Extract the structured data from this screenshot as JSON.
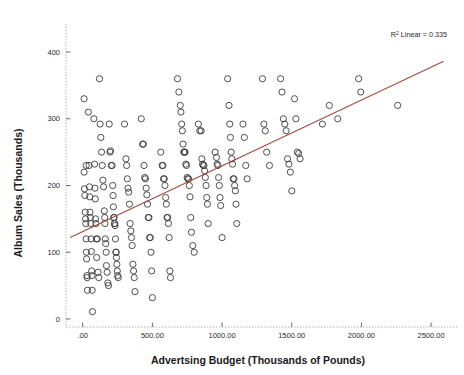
{
  "chart_data": {
    "type": "scatter",
    "title": "",
    "xlabel": "Advertsing Budget (Thousands of Pounds)",
    "ylabel": "Album Sales (Thousands)",
    "xlim": [
      -120,
      2650
    ],
    "ylim": [
      -12,
      430
    ],
    "xticks": [
      0,
      500,
      1000,
      1500,
      2000,
      2500
    ],
    "xticklabels": [
      ".00",
      "500.00",
      "1000.00",
      "1500.00",
      "2000.00",
      "2500.00"
    ],
    "yticks": [
      0,
      100,
      200,
      300,
      400
    ],
    "yticklabels": [
      "0",
      "100",
      "200",
      "300",
      "400"
    ],
    "grid": false,
    "legend": null,
    "annotations": [
      {
        "name": "r-squared",
        "prefix": "R",
        "superscript": "2",
        "text": " Linear = 0.335",
        "full_text": "R2 Linear = 0.335",
        "value": 0.335,
        "x": 2350,
        "y": 425
      }
    ],
    "marker": {
      "shape": "open-circle",
      "radius_px": 3.1,
      "stroke": "#3a3a3a",
      "fill": "none"
    },
    "fit_line": {
      "name": "linear-fit",
      "color": "#a24a3c",
      "x_start": -90,
      "y_start": 122,
      "x_end": 2590,
      "y_end": 386,
      "slope": 0.0985,
      "intercept": 131.0
    },
    "n_points": 200,
    "points": [
      [
        10,
        330
      ],
      [
        25,
        230
      ],
      [
        10,
        220
      ],
      [
        12,
        195
      ],
      [
        15,
        185
      ],
      [
        18,
        160
      ],
      [
        20,
        150
      ],
      [
        22,
        143
      ],
      [
        24,
        120
      ],
      [
        26,
        100
      ],
      [
        28,
        90
      ],
      [
        30,
        65
      ],
      [
        32,
        62
      ],
      [
        34,
        43
      ],
      [
        40,
        310
      ],
      [
        45,
        230
      ],
      [
        48,
        198
      ],
      [
        50,
        183
      ],
      [
        52,
        160
      ],
      [
        55,
        152
      ],
      [
        58,
        143
      ],
      [
        60,
        120
      ],
      [
        62,
        101
      ],
      [
        64,
        72
      ],
      [
        66,
        65
      ],
      [
        68,
        43
      ],
      [
        70,
        11
      ],
      [
        80,
        300
      ],
      [
        85,
        232
      ],
      [
        88,
        196
      ],
      [
        90,
        180
      ],
      [
        92,
        150
      ],
      [
        95,
        143
      ],
      [
        98,
        120
      ],
      [
        100,
        92
      ],
      [
        105,
        120
      ],
      [
        110,
        70
      ],
      [
        115,
        62
      ],
      [
        120,
        360
      ],
      [
        125,
        292
      ],
      [
        130,
        272
      ],
      [
        135,
        250
      ],
      [
        140,
        230
      ],
      [
        145,
        208
      ],
      [
        150,
        198
      ],
      [
        155,
        162
      ],
      [
        158,
        152
      ],
      [
        160,
        143
      ],
      [
        162,
        120
      ],
      [
        165,
        113
      ],
      [
        168,
        100
      ],
      [
        170,
        80
      ],
      [
        175,
        70
      ],
      [
        180,
        54
      ],
      [
        185,
        50
      ],
      [
        190,
        292
      ],
      [
        195,
        250
      ],
      [
        200,
        252
      ],
      [
        205,
        230
      ],
      [
        210,
        230
      ],
      [
        215,
        200
      ],
      [
        218,
        185
      ],
      [
        220,
        168
      ],
      [
        222,
        152
      ],
      [
        225,
        152
      ],
      [
        228,
        143
      ],
      [
        230,
        143
      ],
      [
        232,
        140
      ],
      [
        235,
        120
      ],
      [
        238,
        100
      ],
      [
        240,
        100
      ],
      [
        242,
        92
      ],
      [
        245,
        82
      ],
      [
        248,
        72
      ],
      [
        250,
        65
      ],
      [
        255,
        62
      ],
      [
        300,
        292
      ],
      [
        310,
        240
      ],
      [
        315,
        230
      ],
      [
        320,
        210
      ],
      [
        325,
        196
      ],
      [
        330,
        190
      ],
      [
        335,
        172
      ],
      [
        340,
        143
      ],
      [
        345,
        132
      ],
      [
        350,
        122
      ],
      [
        355,
        110
      ],
      [
        360,
        82
      ],
      [
        365,
        72
      ],
      [
        370,
        62
      ],
      [
        375,
        41
      ],
      [
        420,
        300
      ],
      [
        430,
        262
      ],
      [
        435,
        262
      ],
      [
        440,
        230
      ],
      [
        445,
        212
      ],
      [
        450,
        210
      ],
      [
        455,
        196
      ],
      [
        460,
        186
      ],
      [
        465,
        172
      ],
      [
        470,
        152
      ],
      [
        475,
        152
      ],
      [
        480,
        122
      ],
      [
        485,
        122
      ],
      [
        490,
        100
      ],
      [
        495,
        72
      ],
      [
        500,
        32
      ],
      [
        560,
        250
      ],
      [
        570,
        230
      ],
      [
        575,
        230
      ],
      [
        580,
        210
      ],
      [
        585,
        210
      ],
      [
        590,
        200
      ],
      [
        595,
        182
      ],
      [
        600,
        172
      ],
      [
        605,
        152
      ],
      [
        610,
        152
      ],
      [
        615,
        143
      ],
      [
        620,
        122
      ],
      [
        625,
        72
      ],
      [
        630,
        62
      ],
      [
        680,
        360
      ],
      [
        690,
        340
      ],
      [
        700,
        320
      ],
      [
        705,
        310
      ],
      [
        710,
        292
      ],
      [
        715,
        282
      ],
      [
        720,
        262
      ],
      [
        725,
        250
      ],
      [
        730,
        250
      ],
      [
        735,
        250
      ],
      [
        740,
        232
      ],
      [
        745,
        230
      ],
      [
        750,
        212
      ],
      [
        755,
        210
      ],
      [
        760,
        210
      ],
      [
        765,
        200
      ],
      [
        770,
        183
      ],
      [
        775,
        152
      ],
      [
        780,
        130
      ],
      [
        790,
        110
      ],
      [
        800,
        100
      ],
      [
        830,
        292
      ],
      [
        840,
        282
      ],
      [
        850,
        282
      ],
      [
        855,
        240
      ],
      [
        860,
        232
      ],
      [
        865,
        230
      ],
      [
        870,
        230
      ],
      [
        875,
        222
      ],
      [
        880,
        212
      ],
      [
        885,
        200
      ],
      [
        890,
        182
      ],
      [
        895,
        172
      ],
      [
        900,
        143
      ],
      [
        950,
        250
      ],
      [
        960,
        242
      ],
      [
        965,
        232
      ],
      [
        970,
        230
      ],
      [
        975,
        212
      ],
      [
        980,
        200
      ],
      [
        985,
        182
      ],
      [
        990,
        170
      ],
      [
        1000,
        122
      ],
      [
        1040,
        360
      ],
      [
        1050,
        320
      ],
      [
        1055,
        292
      ],
      [
        1060,
        272
      ],
      [
        1065,
        250
      ],
      [
        1070,
        240
      ],
      [
        1075,
        232
      ],
      [
        1080,
        210
      ],
      [
        1085,
        210
      ],
      [
        1090,
        200
      ],
      [
        1095,
        192
      ],
      [
        1100,
        172
      ],
      [
        1105,
        143
      ],
      [
        1150,
        292
      ],
      [
        1160,
        272
      ],
      [
        1170,
        230
      ],
      [
        1180,
        210
      ],
      [
        1290,
        360
      ],
      [
        1300,
        292
      ],
      [
        1310,
        282
      ],
      [
        1320,
        250
      ],
      [
        1340,
        230
      ],
      [
        1420,
        360
      ],
      [
        1430,
        340
      ],
      [
        1440,
        300
      ],
      [
        1450,
        292
      ],
      [
        1460,
        282
      ],
      [
        1470,
        240
      ],
      [
        1480,
        232
      ],
      [
        1490,
        220
      ],
      [
        1500,
        192
      ],
      [
        1520,
        330
      ],
      [
        1530,
        300
      ],
      [
        1540,
        250
      ],
      [
        1550,
        248
      ],
      [
        1560,
        240
      ],
      [
        1720,
        292
      ],
      [
        1770,
        320
      ],
      [
        1830,
        300
      ],
      [
        1980,
        360
      ],
      [
        1995,
        340
      ],
      [
        2260,
        320
      ]
    ]
  }
}
